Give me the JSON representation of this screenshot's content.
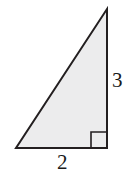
{
  "figure": {
    "name": "right-triangle-diagram",
    "background_color": "#ffffff",
    "shape": {
      "kind": "right-triangle",
      "fill_color": "#ececed",
      "stroke_color": "#231f20",
      "stroke_width": 2,
      "vertices": {
        "apex": {
          "x": 107,
          "y": 9
        },
        "bottom_right": {
          "x": 107,
          "y": 148
        },
        "bottom_left": {
          "x": 16,
          "y": 148
        }
      }
    },
    "right_angle_marker": {
      "name": "right-angle-marker",
      "vertex": {
        "x": 107,
        "y": 148
      },
      "size": 16,
      "stroke_color": "#231f20",
      "stroke_width": 1.6
    },
    "labels": {
      "vertical_leg": "3",
      "horizontal_leg": "2"
    }
  },
  "chart_data": {
    "type": "diagram",
    "title": "",
    "shape": "right triangle",
    "sides": [
      {
        "name": "vertical leg",
        "label": "3",
        "value": 3
      },
      {
        "name": "horizontal leg",
        "label": "2",
        "value": 2
      }
    ],
    "annotations": [
      "right angle square at bottom-right vertex"
    ]
  }
}
